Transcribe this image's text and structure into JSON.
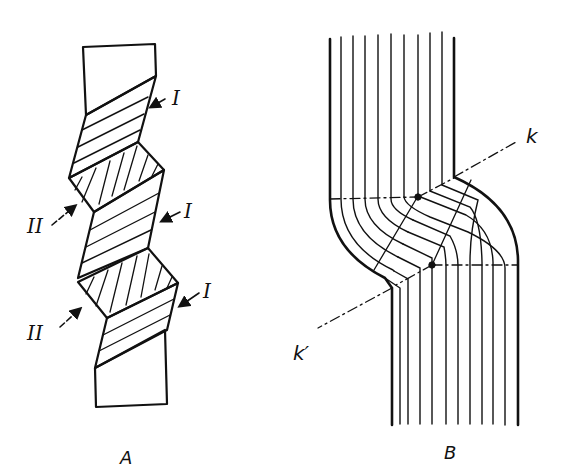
{
  "figure": {
    "panels": [
      {
        "id": "A",
        "caption": "A",
        "description": "Twisted crystal strip with alternating twinned segments",
        "labels": [
          {
            "text": "I",
            "x": 176,
            "y": 103
          },
          {
            "text": "II",
            "x": 30,
            "y": 230
          },
          {
            "text": "I",
            "x": 187,
            "y": 215
          },
          {
            "text": "II",
            "x": 30,
            "y": 337
          },
          {
            "text": "I",
            "x": 205,
            "y": 300
          }
        ]
      },
      {
        "id": "B",
        "caption": "B",
        "description": "Lamellae bent through a kink band bounded by planes k and k'",
        "labels": [
          {
            "text": "k",
            "x": 531,
            "y": 140
          },
          {
            "text": "k′",
            "x": 297,
            "y": 357
          }
        ]
      }
    ]
  }
}
